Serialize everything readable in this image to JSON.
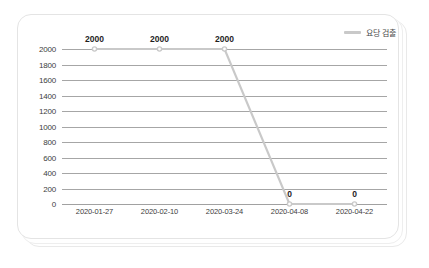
{
  "chart_data": {
    "type": "line",
    "title": "",
    "xlabel": "",
    "ylabel": "",
    "categories": [
      "2020-01-27",
      "2020-02-10",
      "2020-03-24",
      "2020-04-08",
      "2020-04-22"
    ],
    "series": [
      {
        "name": "요당 검출",
        "values": [
          2000,
          2000,
          2000,
          0,
          0
        ],
        "color": "#c9c9c9",
        "marker": "circle"
      }
    ],
    "point_labels": [
      "2000",
      "2000",
      "2000",
      "0",
      "0"
    ],
    "yticks": [
      2000,
      1800,
      1600,
      1400,
      1200,
      1000,
      800,
      600,
      400,
      200,
      0
    ],
    "ytick_labels": [
      "2000",
      "1800",
      "1600",
      "1400",
      "1200",
      "1000",
      "800",
      "600",
      "400",
      "200",
      "0"
    ],
    "ylim": [
      0,
      2000
    ],
    "grid": true,
    "legend_position": "top-right",
    "legend": [
      {
        "label": "요당 검출",
        "color": "#c9c9c9",
        "swatch": "line-swatch"
      }
    ]
  },
  "card": {
    "background": "#ffffff",
    "border_color": "#e4e4e4"
  }
}
